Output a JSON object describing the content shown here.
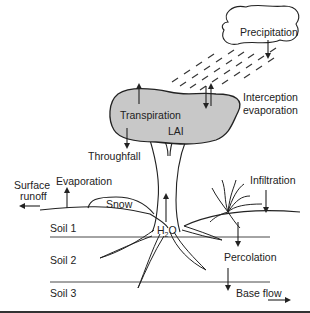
{
  "diagram": {
    "labels": {
      "precipitation": "Precipitation",
      "interception_1": "Interception",
      "interception_2": "evaporation",
      "transpiration": "Transpiration",
      "lai": "LAI",
      "throughfall": "Throughfall",
      "surface_runoff_1": "Surface",
      "surface_runoff_2": "runoff",
      "evaporation": "Evaporation",
      "snow": "Snow",
      "infiltration": "Infiltration",
      "h2o": "H",
      "h2o_sub": "2",
      "h2o_o": "O",
      "soil1": "Soil 1",
      "soil2": "Soil 2",
      "soil3": "Soil 3",
      "percolation": "Percolation",
      "base_flow": "Base flow"
    },
    "colors": {
      "canopy_fill": "#c8c8c8",
      "line": "#222222",
      "background": "#ffffff"
    }
  }
}
